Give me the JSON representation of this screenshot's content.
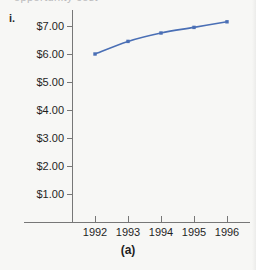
{
  "figure": {
    "item_label": "i.",
    "caption": "(a)",
    "cropped_header_text": "opportunity cost",
    "background_color": "#f7f7f5",
    "axis_color": "#777777"
  },
  "chart_data": {
    "type": "line",
    "title": "",
    "subtitle": "",
    "xlabel": "",
    "ylabel": "",
    "categories": [
      "1992",
      "1993",
      "1994",
      "1995",
      "1996"
    ],
    "x": [
      1992,
      1993,
      1994,
      1995,
      1996
    ],
    "values": [
      6.0,
      6.45,
      6.75,
      6.95,
      7.15
    ],
    "value_prefix": "$",
    "ylim": [
      0,
      7.5
    ],
    "y_ticks": [
      1,
      2,
      3,
      4,
      5,
      6,
      7
    ],
    "y_tick_labels": [
      "$1.00",
      "$2.00",
      "$3.00",
      "$4.00",
      "$5.00",
      "$6.00",
      "$7.00"
    ],
    "x_tick_labels": [
      "1992",
      "1993",
      "1994",
      "1995",
      "1996"
    ],
    "grid": false,
    "legend": false,
    "legend_position": "none",
    "series": [
      {
        "name": "value",
        "color": "#4a6fb5",
        "marker": "square",
        "values": [
          6.0,
          6.45,
          6.75,
          6.95,
          7.15
        ]
      }
    ],
    "annotations": []
  }
}
